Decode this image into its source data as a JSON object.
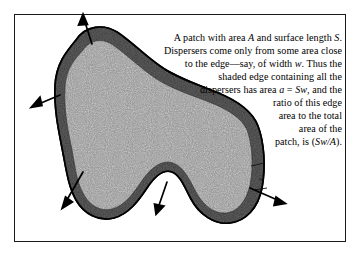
{
  "figure": {
    "frame": {
      "border_color": "#1a1a1a"
    },
    "patch": {
      "band_label": "shaded edge band",
      "band_color": "#3a3a3a",
      "interior_color": "#8a8a8a",
      "outline_color": "#000000"
    },
    "width_marker": {
      "label": "w"
    }
  },
  "caption": {
    "lines": [
      {
        "parts": [
          {
            "t": "A patch with area "
          },
          {
            "t": "A",
            "em": true
          },
          {
            "t": " and surface length "
          },
          {
            "t": "S",
            "em": true
          },
          {
            "t": "."
          }
        ]
      },
      {
        "parts": [
          {
            "t": "Dispersers come only from some area close"
          }
        ]
      },
      {
        "parts": [
          {
            "t": "to the edge—say, of width "
          },
          {
            "t": "w",
            "em": true
          },
          {
            "t": ".  Thus the"
          }
        ]
      },
      {
        "parts": [
          {
            "t": "shaded edge containing all the"
          }
        ]
      },
      {
        "parts": [
          {
            "t": "dispersers has area "
          },
          {
            "t": "a",
            "em": true
          },
          {
            "t": " = "
          },
          {
            "t": "Sw",
            "em": true
          },
          {
            "t": ", and the"
          }
        ]
      },
      {
        "parts": [
          {
            "t": "ratio of this edge"
          }
        ]
      },
      {
        "parts": [
          {
            "t": "area to the total"
          }
        ]
      },
      {
        "parts": [
          {
            "t": "area of the"
          }
        ]
      },
      {
        "parts": [
          {
            "t": "patch, is ("
          },
          {
            "t": "Sw/A",
            "em": true
          },
          {
            "t": ")."
          }
        ]
      }
    ]
  },
  "arrows": [
    {
      "name": "arrow-top",
      "angle_deg": 282
    },
    {
      "name": "arrow-upper-left",
      "angle_deg": 205
    },
    {
      "name": "arrow-lower-left",
      "angle_deg": 242
    },
    {
      "name": "arrow-bottom",
      "angle_deg": 290
    },
    {
      "name": "arrow-lower-right",
      "angle_deg": 25
    }
  ]
}
